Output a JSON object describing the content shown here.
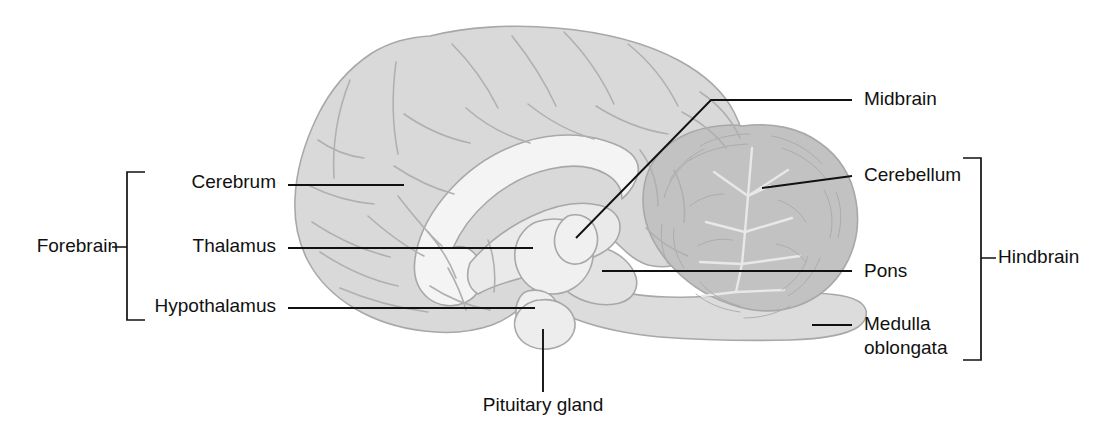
{
  "figure": {
    "background_color": "#ffffff",
    "width": 1112,
    "height": 441
  },
  "palette": {
    "cerebrum_fill": "#d9d9d9",
    "cerebellum_fill": "#c2c2c2",
    "brainstem_fill": "#dcdcdc",
    "white_matter_fill": "#f2f2f2",
    "nucleus_fill": "#efefef",
    "outline_stroke": "#a8a8a8",
    "label_color": "#111111",
    "leader_color": "#111111"
  },
  "groups": [
    {
      "id": "forebrain",
      "label": "Forebrain",
      "side": "left",
      "label_x": 118,
      "label_y": 247,
      "bracket_x": 127,
      "bracket_top": 172,
      "bracket_bottom": 320,
      "tick_y": 247
    },
    {
      "id": "hindbrain",
      "label": "Hindbrain",
      "side": "right",
      "label_x": 998,
      "label_y": 258,
      "bracket_x": 981,
      "bracket_top": 158,
      "bracket_bottom": 360,
      "tick_y": 258
    }
  ],
  "labels": [
    {
      "id": "cerebrum",
      "text": "Cerebrum",
      "side": "left",
      "text_x": 276,
      "text_y": 183,
      "leader": "M 288 185 L 404 185"
    },
    {
      "id": "thalamus",
      "text": "Thalamus",
      "side": "left",
      "text_x": 276,
      "text_y": 247,
      "leader": "M 288 248 L 533 248"
    },
    {
      "id": "hypothalamus",
      "text": "Hypothalamus",
      "side": "left",
      "text_x": 276,
      "text_y": 307,
      "leader": "M 288 308 L 535 308"
    },
    {
      "id": "midbrain",
      "text": "Midbrain",
      "side": "right",
      "text_x": 864,
      "text_y": 100,
      "leader": "M 576 238 L 711 100 L 852 100"
    },
    {
      "id": "cerebellum",
      "text": "Cerebellum",
      "side": "right",
      "text_x": 864,
      "text_y": 176,
      "leader": "M 762 188 L 852 176"
    },
    {
      "id": "pons",
      "text": "Pons",
      "side": "right",
      "text_x": 864,
      "text_y": 272,
      "leader": "M 602 271 L 852 271"
    },
    {
      "id": "medulla-oblongata",
      "text": "Medulla",
      "text_line2": "oblongata",
      "side": "right",
      "text_x": 864,
      "text_y": 325,
      "text_y2": 349,
      "leader": "M 812 325 L 852 325"
    },
    {
      "id": "pituitary-gland",
      "text": "Pituitary gland",
      "side": "bottom",
      "text_x": 543,
      "text_y": 406,
      "leader": "M 543 329 L 543 392"
    }
  ]
}
